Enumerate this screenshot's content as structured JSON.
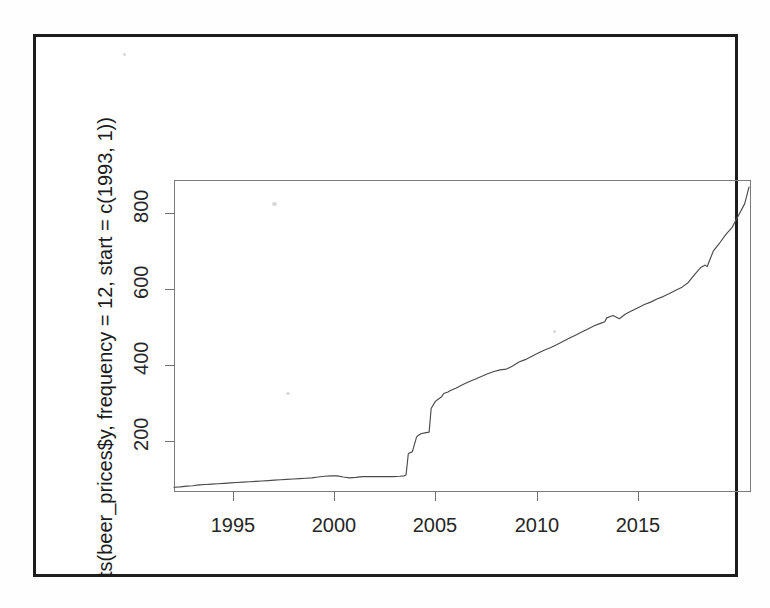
{
  "figure": {
    "ylab": "ts(beer_prices$y, frequency = 12, start = c(1993, 1))",
    "xlab": "Time"
  },
  "chart_data": {
    "type": "line",
    "title": "",
    "xlabel": "Time",
    "ylabel": "ts(beer_prices$y, frequency = 12, start = c(1993, 1))",
    "xlim": [
      1993.0,
      2016.0
    ],
    "ylim": [
      88,
      880
    ],
    "xticks": [
      1995,
      2000,
      2005,
      2010,
      2015
    ],
    "yticks": [
      200,
      400,
      600,
      800
    ],
    "xtick_labels": [
      "1995",
      "2000",
      "2005",
      "2010",
      "2015"
    ],
    "ytick_labels": [
      "200",
      "400",
      "600",
      "800"
    ],
    "grid": false,
    "legend": null,
    "series": [
      {
        "name": "beer_prices$y",
        "frequency": 12,
        "start": [
          1993,
          1
        ],
        "x": [
          1993.0,
          1993.25,
          1993.5,
          1993.75,
          1994.0,
          1994.25,
          1994.5,
          1994.75,
          1995.0,
          1995.25,
          1995.5,
          1995.75,
          1996.0,
          1996.25,
          1996.5,
          1996.75,
          1997.0,
          1997.25,
          1997.5,
          1997.75,
          1998.0,
          1998.25,
          1998.5,
          1998.75,
          1999.0,
          1999.25,
          1999.5,
          1999.75,
          2000.0,
          2000.25,
          2000.5,
          2000.75,
          2001.0,
          2001.25,
          2001.5,
          2001.75,
          2002.0,
          2002.17,
          2002.25,
          2002.34,
          2002.42,
          2002.5,
          2002.67,
          2002.75,
          2002.84,
          2003.0,
          2003.17,
          2003.25,
          2003.42,
          2003.5,
          2003.67,
          2003.75,
          2003.92,
          2004.0,
          2004.25,
          2004.5,
          2004.75,
          2005.0,
          2005.25,
          2005.5,
          2005.75,
          2006.0,
          2006.25,
          2006.5,
          2006.75,
          2007.0,
          2007.25,
          2007.5,
          2007.75,
          2008.0,
          2008.25,
          2008.5,
          2008.75,
          2009.0,
          2009.25,
          2009.5,
          2009.75,
          2010.0,
          2010.17,
          2010.25,
          2010.5,
          2010.75,
          2011.0,
          2011.25,
          2011.5,
          2011.75,
          2012.0,
          2012.25,
          2012.5,
          2012.75,
          2013.0,
          2013.25,
          2013.5,
          2013.75,
          2014.0,
          2014.17,
          2014.25,
          2014.5,
          2014.75,
          2015.0,
          2015.25,
          2015.5,
          2015.75,
          2015.92
        ],
        "y": [
          100,
          101,
          103,
          104,
          106,
          107,
          108,
          109,
          110,
          111,
          112,
          113,
          114,
          115,
          116,
          117,
          118,
          119,
          120,
          121,
          122,
          123,
          124,
          126,
          128,
          129,
          129,
          126,
          124,
          125,
          127,
          127,
          127,
          127,
          127,
          127,
          128,
          129,
          131,
          185,
          188,
          190,
          228,
          232,
          236,
          238,
          240,
          300,
          318,
          322,
          330,
          338,
          342,
          345,
          352,
          360,
          368,
          374,
          381,
          388,
          394,
          398,
          400,
          408,
          418,
          424,
          432,
          440,
          448,
          454,
          462,
          470,
          478,
          486,
          494,
          502,
          510,
          516,
          520,
          530,
          536,
          528,
          540,
          548,
          556,
          564,
          570,
          578,
          584,
          592,
          600,
          608,
          620,
          640,
          658,
          664,
          660,
          700,
          720,
          742,
          760,
          790,
          820,
          862
        ]
      }
    ]
  }
}
